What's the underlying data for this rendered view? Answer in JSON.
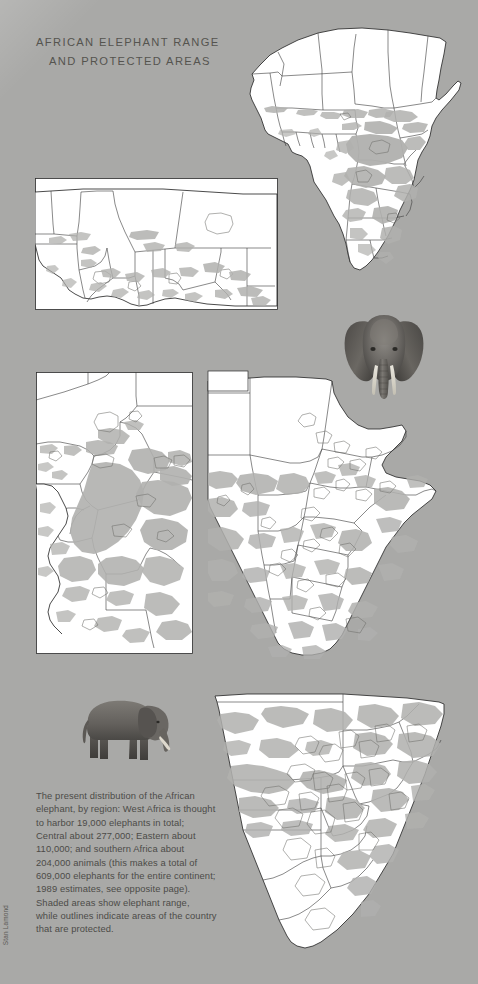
{
  "page": {
    "background_color": "#a9a9a7",
    "width": 478,
    "height": 984
  },
  "title": {
    "line1": "AFRICAN ELEPHANT RANGE",
    "line2": "AND PROTECTED AREAS",
    "color": "#55544f"
  },
  "caption": {
    "text": "The present distribution of the African elephant, by region: West Africa is thought to harbor 19,000 elephants in total; Central about 277,000; Eastern about 110,000; and southern Africa about 204,000 animals (this makes a total of 609,000 elephants for the entire continent; 1989 estimates, see opposite page). Shaded areas show elephant range, while outlines indicate areas of the country that are protected.",
    "lines": [
      "The present distribution of the African",
      "elephant, by region: West Africa is thought",
      "to harbor 19,000 elephants in total;",
      "Central about 277,000; Eastern about",
      "110,000; and southern Africa about",
      "204,000 animals (this makes a total of",
      "609,000 elephants for the entire continent;",
      "1989 estimates, see opposite page).",
      "Shaded areas show elephant range,",
      "while outlines indicate areas of the country",
      "that are protected."
    ],
    "color": "#4c4b47"
  },
  "credit": {
    "text": "Stan Lamond"
  },
  "statistics": {
    "west_africa": "19,000",
    "central_africa": "277,000",
    "eastern_africa": "110,000",
    "southern_africa": "204,000",
    "continent_total": "609,000",
    "estimate_year": "1989"
  },
  "legend": {
    "range_description": "Shaded areas show elephant range",
    "protected_description": "outlines indicate areas of the country that are protected",
    "range_color": "#b0b0ae",
    "protected_outline_color": "#6e6e6a",
    "land_color": "#ffffff",
    "border_color": "#2b2b2b"
  },
  "maps": [
    {
      "id": "africa-overview",
      "name": "Africa continent overview",
      "region": "Africa"
    },
    {
      "id": "west-africa",
      "name": "West Africa detail",
      "region": "West Africa"
    },
    {
      "id": "central-africa",
      "name": "Central Africa detail",
      "region": "Central Africa"
    },
    {
      "id": "eastern-africa",
      "name": "Eastern Africa detail",
      "region": "Eastern Africa"
    },
    {
      "id": "southern-africa",
      "name": "Southern Africa detail",
      "region": "Southern Africa"
    }
  ],
  "illustrations": [
    {
      "id": "elephant-head",
      "name": "African elephant head, front view"
    },
    {
      "id": "elephant-body",
      "name": "African elephant, side view"
    }
  ]
}
